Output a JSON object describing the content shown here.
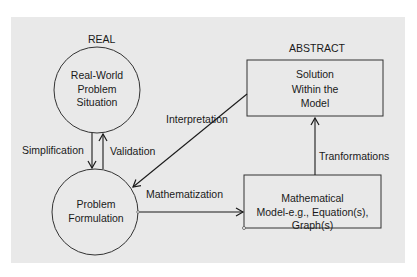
{
  "diagram": {
    "type": "flow-cycle",
    "regions": {
      "real": "REAL",
      "abstract": "ABSTRACT"
    },
    "nodes": {
      "real_world": {
        "shape": "circle",
        "lines": [
          "Real-World",
          "Problem",
          "Situation"
        ]
      },
      "problem_formulation": {
        "shape": "circle",
        "lines": [
          "Problem",
          "Formulation"
        ]
      },
      "solution": {
        "shape": "rectangle",
        "lines": [
          "Solution",
          "Within the",
          "Model"
        ]
      },
      "math_model": {
        "shape": "rectangle",
        "lines": [
          "Mathematical",
          "Model-e.g., Equation(s),",
          "Graph(s)"
        ]
      }
    },
    "edges": {
      "simplification": {
        "label": "Simplification",
        "from": "Real-World Problem Situation",
        "to": "Problem Formulation"
      },
      "validation": {
        "label": "Validation",
        "from": "Problem Formulation",
        "to": "Real-World Problem Situation"
      },
      "mathematization": {
        "label": "Mathematization",
        "from": "Problem Formulation",
        "to": "Mathematical Model"
      },
      "transformations": {
        "label": "Tranformations",
        "from": "Mathematical Model",
        "to": "Solution Within the Model"
      },
      "interpretation": {
        "label": "Interpretation",
        "from": "Solution Within the Model",
        "to": "Problem Formulation"
      }
    },
    "colors": {
      "background": "#e9e9e9",
      "stroke": "#1a1a1a"
    }
  }
}
